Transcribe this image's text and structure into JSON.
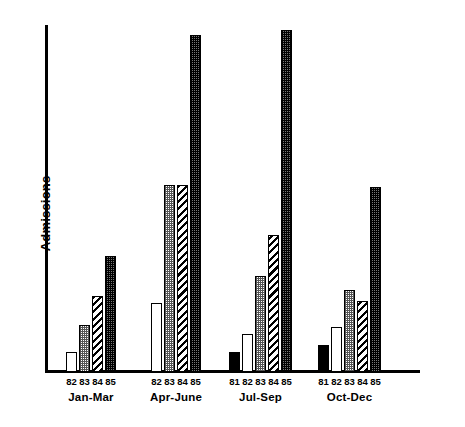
{
  "chart_data": {
    "type": "bar",
    "title": "",
    "xlabel": "",
    "ylabel": "Admissions",
    "grid": false,
    "legend": "none",
    "axis_note": "y-axis has no tick marks or numeric labels; values are relative bar heights read off pixels",
    "categories": [
      "Jan-Mar",
      "Apr-June",
      "Jul-Sep",
      "Oct-Dec"
    ],
    "series": [
      {
        "name": "81",
        "pattern": "solid-black",
        "values": [
          null,
          null,
          20,
          27
        ]
      },
      {
        "name": "82",
        "pattern": "white",
        "values": [
          20,
          69,
          38,
          45
        ]
      },
      {
        "name": "83",
        "pattern": "light-dots",
        "values": [
          47,
          187,
          96,
          82
        ]
      },
      {
        "name": "84",
        "pattern": "diagonal-hatch",
        "values": [
          76,
          187,
          137,
          71
        ]
      },
      {
        "name": "85",
        "pattern": "dark-dense",
        "values": [
          116,
          337,
          342,
          185
        ]
      }
    ],
    "groups": [
      {
        "label": "Jan-Mar",
        "bars": [
          {
            "tick": "82",
            "value": 20,
            "pattern": "white"
          },
          {
            "tick": "83",
            "value": 47,
            "pattern": "light-dots"
          },
          {
            "tick": "84",
            "value": 76,
            "pattern": "diagonal-hatch"
          },
          {
            "tick": "85",
            "value": 116,
            "pattern": "dark-dense"
          }
        ]
      },
      {
        "label": "Apr-June",
        "bars": [
          {
            "tick": "82",
            "value": 69,
            "pattern": "white"
          },
          {
            "tick": "83",
            "value": 187,
            "pattern": "light-dots"
          },
          {
            "tick": "84",
            "value": 187,
            "pattern": "diagonal-hatch"
          },
          {
            "tick": "85",
            "value": 337,
            "pattern": "dark-dense"
          }
        ]
      },
      {
        "label": "Jul-Sep",
        "bars": [
          {
            "tick": "81",
            "value": 20,
            "pattern": "solid-black"
          },
          {
            "tick": "82",
            "value": 38,
            "pattern": "white"
          },
          {
            "tick": "83",
            "value": 96,
            "pattern": "light-dots"
          },
          {
            "tick": "84",
            "value": 137,
            "pattern": "diagonal-hatch"
          },
          {
            "tick": "85",
            "value": 342,
            "pattern": "dark-dense"
          }
        ]
      },
      {
        "label": "Oct-Dec",
        "bars": [
          {
            "tick": "81",
            "value": 27,
            "pattern": "solid-black"
          },
          {
            "tick": "82",
            "value": 45,
            "pattern": "white"
          },
          {
            "tick": "83",
            "value": 82,
            "pattern": "light-dots"
          },
          {
            "tick": "84",
            "value": 71,
            "pattern": "diagonal-hatch"
          },
          {
            "tick": "85",
            "value": 185,
            "pattern": "dark-dense"
          }
        ]
      }
    ]
  },
  "colors": {
    "axis": "#000000",
    "bar_outline": "#000000",
    "fill_white": "#ffffff",
    "fill_black": "#000000",
    "fill_light_dots": "#c8c8c8",
    "fill_dark_dense": "#606060"
  }
}
